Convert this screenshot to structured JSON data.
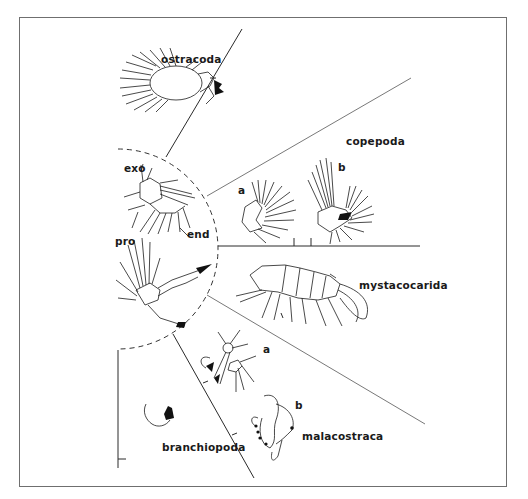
{
  "figure": {
    "type": "line-drawing diagram of crustacean naupliar appendages",
    "groups": [
      {
        "id": "ostracoda",
        "label": "ostracoda"
      },
      {
        "id": "copepoda",
        "label": "copepoda",
        "parts": [
          "a",
          "b"
        ]
      },
      {
        "id": "mystacocarida",
        "label": "mystacocarida"
      },
      {
        "id": "malacostraca",
        "label": "malacostraca",
        "parts": [
          "a",
          "b"
        ]
      },
      {
        "id": "branchiopoda",
        "label": "branchiopoda"
      }
    ],
    "center_labels": {
      "exo": "exo",
      "end": "end",
      "pro": "pro"
    },
    "part_labels": {
      "copepoda_a": "a",
      "copepoda_b": "b",
      "malacostraca_a": "a",
      "malacostraca_b": "b"
    },
    "colors": {
      "background": "#ffffff",
      "ink": "#1c1c1c",
      "frame": "#6f6f6f"
    }
  }
}
